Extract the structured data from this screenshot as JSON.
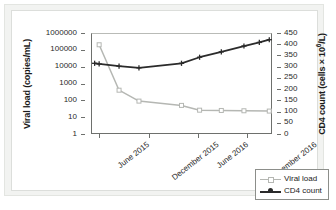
{
  "chart_data": {
    "type": "line",
    "title": "",
    "xlabel": "",
    "grid": false,
    "legend_position": "bottom-right",
    "x_tick_labels": [
      "June 2015",
      "December 2015",
      "June 2016",
      "December 2016"
    ],
    "x_tick_positions": [
      0.045,
      0.318,
      0.59,
      0.862
    ],
    "axes": {
      "left": {
        "label": "Viral load (copies/mL)",
        "scale": "log",
        "ylim": [
          1,
          1000000
        ],
        "ticks": [
          1,
          10,
          100,
          1000,
          10000,
          100000,
          1000000
        ],
        "tick_labels": [
          "1",
          "10",
          "100",
          "1000",
          "10000",
          "100000",
          "1000000"
        ]
      },
      "right": {
        "label_html": "CD4 count (cells × 10<sup>6</sup>/L)",
        "label": "CD4 count (cells × 10⁶/L)",
        "scale": "linear",
        "ylim": [
          0,
          450
        ],
        "ticks": [
          0,
          50,
          100,
          150,
          200,
          250,
          300,
          350,
          400,
          450
        ],
        "tick_labels": [
          "0",
          "50",
          "100",
          "150",
          "200",
          "250",
          "300",
          "350",
          "400",
          "450"
        ]
      }
    },
    "series": [
      {
        "name": "Viral load",
        "axis": "left",
        "color": "#b5b7b3",
        "marker": "square",
        "x": [
          0.045,
          0.142,
          0.238,
          0.318,
          0.5,
          0.59,
          0.68,
          0.775,
          0.862,
          0.955
        ],
        "values": [
          200000,
          400,
          90,
          90,
          50,
          50,
          25,
          25,
          25,
          25
        ],
        "points": [
          {
            "x": 0.045,
            "y": 200000
          },
          {
            "x": 0.155,
            "y": 400
          },
          {
            "x": 0.265,
            "y": 90
          },
          {
            "x": 0.5,
            "y": 50
          },
          {
            "x": 0.6,
            "y": 26
          },
          {
            "x": 0.72,
            "y": 25
          },
          {
            "x": 0.845,
            "y": 24
          },
          {
            "x": 0.985,
            "y": 23
          }
        ]
      },
      {
        "name": "CD4 count",
        "axis": "right",
        "color": "#2b2b2b",
        "marker": "plus",
        "x": [
          0.02,
          0.045,
          0.155,
          0.265,
          0.5,
          0.6,
          0.72,
          0.845,
          0.93,
          0.985
        ],
        "values": [
          315,
          310,
          300,
          295,
          315,
          345,
          365,
          390,
          410,
          420
        ],
        "points": [
          {
            "x": 0.02,
            "y": 315
          },
          {
            "x": 0.045,
            "y": 312
          },
          {
            "x": 0.155,
            "y": 302
          },
          {
            "x": 0.265,
            "y": 295
          },
          {
            "x": 0.5,
            "y": 315
          },
          {
            "x": 0.6,
            "y": 342
          },
          {
            "x": 0.72,
            "y": 366
          },
          {
            "x": 0.845,
            "y": 392
          },
          {
            "x": 0.93,
            "y": 408
          },
          {
            "x": 0.985,
            "y": 420
          }
        ]
      }
    ]
  },
  "legend": {
    "entries": [
      {
        "label": "Viral load",
        "color": "#b5b7b3",
        "marker": "square"
      },
      {
        "label": "CD4 count",
        "color": "#2b2b2b",
        "marker": "plus"
      }
    ]
  },
  "colors": {
    "viral_load": "#b5b7b3",
    "cd4_count": "#2b2b2b",
    "axis": "#6e706d",
    "panel_background": "#ffffff",
    "outer_background": "#f2f3f1"
  }
}
